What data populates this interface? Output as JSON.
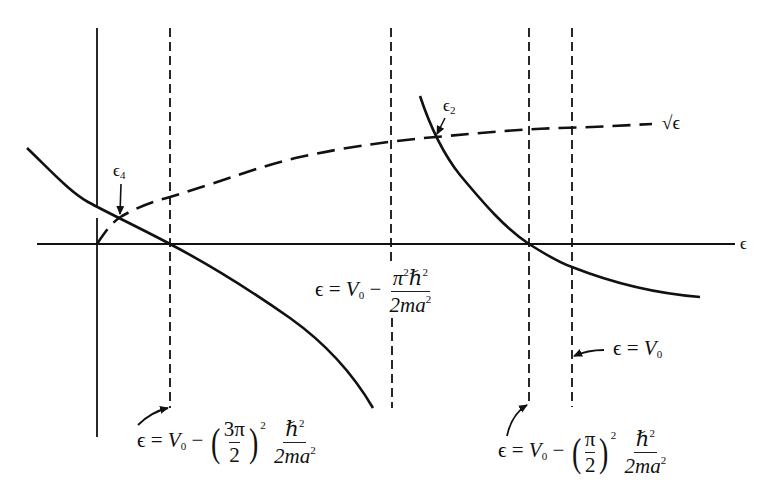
{
  "figure": {
    "type": "graphical-solution",
    "axis_label": "ϵ",
    "curve_label": "√ϵ",
    "points": {
      "eps4": {
        "base": "ϵ",
        "sub": "4"
      },
      "eps2": {
        "base": "ϵ",
        "sub": "2"
      }
    },
    "asymptotes": [
      {
        "id": "three-pi-over-two",
        "lhs": "ϵ",
        "eq": "=",
        "V": "V",
        "V_sub": "0",
        "minus": "−",
        "paren_num": "3π",
        "paren_den": "2",
        "power": "2",
        "frac_num": "ℏ",
        "frac_num_sup": "2",
        "frac_den": "2ma",
        "frac_den_sup": "2"
      },
      {
        "id": "pi-squared",
        "lhs": "ϵ",
        "eq": "=",
        "V": "V",
        "V_sub": "0",
        "minus": "−",
        "frac_num": "π",
        "frac_num_sup1": "2",
        "frac_num2": "ℏ",
        "frac_num_sup2": "2",
        "frac_den": "2ma",
        "frac_den_sup": "2"
      },
      {
        "id": "pi-over-two",
        "lhs": "ϵ",
        "eq": "=",
        "V": "V",
        "V_sub": "0",
        "minus": "−",
        "paren_num": "π",
        "paren_den": "2",
        "power": "2",
        "frac_num": "ℏ",
        "frac_num_sup": "2",
        "frac_den": "2ma",
        "frac_den_sup": "2"
      },
      {
        "id": "v0",
        "lhs": "ϵ",
        "eq": "=",
        "V": "V",
        "V_sub": "0"
      }
    ],
    "colors": {
      "ink": "#111111",
      "background": "#ffffff"
    }
  }
}
